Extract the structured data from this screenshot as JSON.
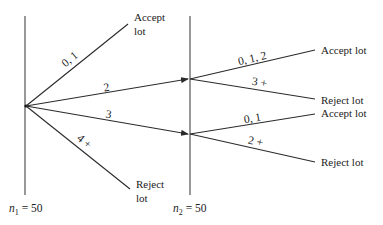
{
  "diagram": {
    "type": "double-sampling-plan",
    "stages": [
      {
        "label_var": "n",
        "label_sub": "1",
        "label_eq": " = 50",
        "x": 25
      },
      {
        "label_var": "n",
        "label_sub": "2",
        "label_eq": " = 50",
        "x": 190
      }
    ],
    "first_sample_branches": [
      {
        "defects": "0, 1",
        "outcome_line1": "Accept",
        "outcome_line2": "lot"
      },
      {
        "defects": "2",
        "outcome": "to second sample"
      },
      {
        "defects": "3",
        "outcome": "to second sample"
      },
      {
        "defects": "4 +",
        "outcome_line1": "Reject",
        "outcome_line2": "lot"
      }
    ],
    "second_sample_branches": {
      "after_2": [
        {
          "defects": "0, 1, 2",
          "outcome": "Accept lot"
        },
        {
          "defects": "3 +",
          "outcome": "Reject lot"
        }
      ],
      "after_3": [
        {
          "defects": "0, 1",
          "outcome": "Accept lot"
        },
        {
          "defects": "2 +",
          "outcome": "Reject lot"
        }
      ]
    },
    "colors": {
      "line": "#2a2a2a",
      "text": "#222222",
      "background": "#ffffff"
    }
  }
}
